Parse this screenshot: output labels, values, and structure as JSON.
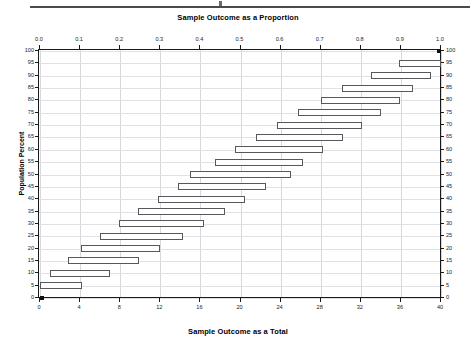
{
  "chart_data": {
    "type": "bar",
    "title": "Sample Outcome as a Proportion",
    "xlabel": "Sample Outcome as a  Total",
    "ylabel": "Population Percent",
    "orientation": "horizontal",
    "grid": true,
    "legend": null,
    "top_axis": {
      "label": "Sample Outcome as a Proportion",
      "range": [
        0.0,
        1.0
      ],
      "ticks": [
        0.0,
        0.1,
        0.2,
        0.3,
        0.4,
        0.5,
        0.6,
        0.7,
        0.8,
        0.9,
        1.0
      ],
      "tick_labels": [
        "0.0",
        "0.1",
        "0.2",
        "0.3",
        "0.4",
        "0.5",
        "0.6",
        "0.7",
        "0.8",
        "0.9",
        "1.0"
      ]
    },
    "bottom_axis": {
      "label": "Sample Outcome as a  Total",
      "range": [
        0,
        40
      ],
      "ticks": [
        0,
        4,
        8,
        12,
        16,
        20,
        24,
        28,
        32,
        36,
        40
      ],
      "tick_labels": [
        "0",
        "4",
        "8",
        "12",
        "16",
        "20",
        "24",
        "28",
        "32",
        "36",
        "40"
      ]
    },
    "left_axis": {
      "label": "Population Percent",
      "range": [
        0,
        100
      ],
      "ticks": [
        0,
        5,
        10,
        15,
        20,
        25,
        30,
        35,
        40,
        45,
        50,
        55,
        60,
        65,
        70,
        75,
        80,
        85,
        90,
        95,
        100
      ],
      "tick_labels": [
        "0",
        "5",
        "10",
        "15",
        "20",
        "25",
        "30",
        "35",
        "40",
        "45",
        "50",
        "55",
        "60",
        "65",
        "70",
        "75",
        "80",
        "85",
        "90",
        "95",
        "100"
      ]
    },
    "right_axis": {
      "range": [
        0,
        100
      ],
      "ticks": [
        0,
        5,
        10,
        15,
        20,
        25,
        30,
        35,
        40,
        45,
        50,
        55,
        60,
        65,
        70,
        75,
        80,
        85,
        90,
        95,
        100
      ],
      "tick_labels": [
        "0",
        "5",
        "10",
        "15",
        "20",
        "25",
        "30",
        "35",
        "40",
        "45",
        "50",
        "55",
        "60",
        "65",
        "70",
        "75",
        "80",
        "85",
        "90",
        "95",
        "100"
      ]
    },
    "categories": [
      "0",
      "5",
      "10",
      "15",
      "20",
      "25",
      "30",
      "35",
      "40",
      "45",
      "50",
      "55",
      "60",
      "65",
      "70",
      "75",
      "80",
      "85",
      "90",
      "95",
      "100"
    ],
    "series": [
      {
        "name": "Confidence interval (sample total out of 40)",
        "type": "interval",
        "intervals": [
          {
            "population_percent": 0,
            "low": 0.0,
            "high": 0.4
          },
          {
            "population_percent": 5,
            "low": 0.0,
            "high": 4.2
          },
          {
            "population_percent": 10,
            "low": 1.0,
            "high": 7.0
          },
          {
            "population_percent": 15,
            "low": 2.8,
            "high": 9.9
          },
          {
            "population_percent": 20,
            "low": 4.1,
            "high": 12.0
          },
          {
            "population_percent": 25,
            "low": 6.0,
            "high": 14.3
          },
          {
            "population_percent": 30,
            "low": 7.9,
            "high": 16.4
          },
          {
            "population_percent": 35,
            "low": 9.8,
            "high": 18.5
          },
          {
            "population_percent": 40,
            "low": 11.8,
            "high": 20.5
          },
          {
            "population_percent": 45,
            "low": 13.8,
            "high": 22.5
          },
          {
            "population_percent": 50,
            "low": 15.0,
            "high": 25.0
          },
          {
            "population_percent": 55,
            "low": 17.5,
            "high": 26.2
          },
          {
            "population_percent": 60,
            "low": 19.5,
            "high": 28.2
          },
          {
            "population_percent": 65,
            "low": 21.5,
            "high": 30.2
          },
          {
            "population_percent": 70,
            "low": 23.6,
            "high": 32.1
          },
          {
            "population_percent": 75,
            "low": 25.7,
            "high": 34.0
          },
          {
            "population_percent": 80,
            "low": 28.0,
            "high": 35.9
          },
          {
            "population_percent": 85,
            "low": 30.1,
            "high": 37.2
          },
          {
            "population_percent": 90,
            "low": 33.0,
            "high": 39.0
          },
          {
            "population_percent": 95,
            "low": 35.8,
            "high": 40.0
          },
          {
            "population_percent": 100,
            "low": 39.6,
            "high": 40.0
          }
        ]
      }
    ],
    "colors": {
      "bar_edge": "#58585c",
      "bar_fill": "#fefefe",
      "axis": "#1a1a1a",
      "grid": "#d8d8dc",
      "marker": "#101010"
    }
  }
}
